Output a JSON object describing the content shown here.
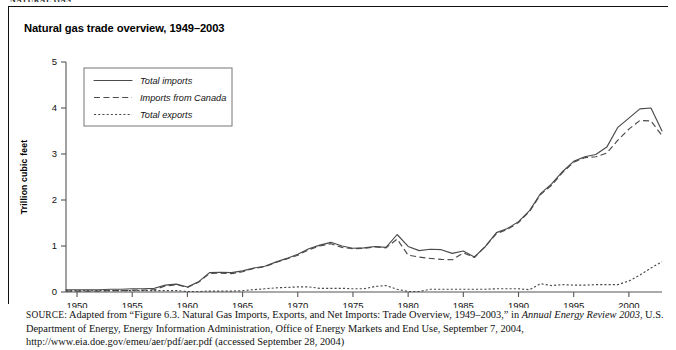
{
  "running_head": "NATURAL GAS",
  "figure": {
    "title": "Natural gas trade overview, 1949–2003"
  },
  "legend": {
    "items": [
      {
        "label": "Total imports",
        "style": "solid"
      },
      {
        "label": "Imports from Canada",
        "style": "dashed"
      },
      {
        "label": "Total exports",
        "style": "dotted"
      }
    ]
  },
  "source": {
    "label": "SOURCE:",
    "text_1": " Adapted from “Figure 6.3. Natural Gas Imports, Exports, and Net Imports: Trade Overview, 1949–2003,” in ",
    "italic_1": "Annual Energy Review 2003",
    "text_2": ", U.S. Department of Energy, Energy Information Administration, Office of Energy Markets and End Use, September 7, 2004, http://www.eia.doe.gov/emeu/aer/pdf/aer.pdf (accessed September 28, 2004)"
  },
  "chart_data": {
    "type": "line",
    "title": "Natural gas trade overview, 1949–2003",
    "xlabel": "",
    "ylabel": "Trillion cubic feet",
    "xlim": [
      1949,
      2003
    ],
    "ylim": [
      0,
      5
    ],
    "yticks": [
      0,
      1,
      2,
      3,
      4,
      5
    ],
    "xticks": [
      1950,
      1955,
      1960,
      1965,
      1970,
      1975,
      1980,
      1985,
      1990,
      1995,
      2000
    ],
    "grid": false,
    "legend_position": "upper-left",
    "x": [
      1949,
      1950,
      1951,
      1952,
      1953,
      1954,
      1955,
      1956,
      1957,
      1958,
      1959,
      1960,
      1961,
      1962,
      1963,
      1964,
      1965,
      1966,
      1967,
      1968,
      1969,
      1970,
      1971,
      1972,
      1973,
      1974,
      1975,
      1976,
      1977,
      1978,
      1979,
      1980,
      1981,
      1982,
      1983,
      1984,
      1985,
      1986,
      1987,
      1988,
      1989,
      1990,
      1991,
      1992,
      1993,
      1994,
      1995,
      1996,
      1997,
      1998,
      1999,
      2000,
      2001,
      2002,
      2003
    ],
    "series": [
      {
        "name": "Total imports",
        "style": "solid",
        "values": [
          0.05,
          0.05,
          0.05,
          0.05,
          0.06,
          0.06,
          0.07,
          0.07,
          0.08,
          0.15,
          0.17,
          0.11,
          0.22,
          0.42,
          0.43,
          0.42,
          0.46,
          0.52,
          0.56,
          0.65,
          0.73,
          0.82,
          0.94,
          1.02,
          1.08,
          1.0,
          0.95,
          0.96,
          0.99,
          0.97,
          1.25,
          0.99,
          0.9,
          0.93,
          0.92,
          0.84,
          0.89,
          0.76,
          0.99,
          1.29,
          1.38,
          1.53,
          1.77,
          2.14,
          2.35,
          2.62,
          2.84,
          2.94,
          2.99,
          3.15,
          3.58,
          3.78,
          3.98,
          4.0,
          3.5
        ]
      },
      {
        "name": "Imports from Canada",
        "style": "dashed",
        "values": [
          0.02,
          0.02,
          0.02,
          0.02,
          0.03,
          0.03,
          0.04,
          0.04,
          0.05,
          0.13,
          0.16,
          0.1,
          0.21,
          0.4,
          0.41,
          0.4,
          0.44,
          0.51,
          0.55,
          0.64,
          0.72,
          0.8,
          0.92,
          1.0,
          1.05,
          0.97,
          0.94,
          0.95,
          0.98,
          0.96,
          1.15,
          0.8,
          0.76,
          0.73,
          0.71,
          0.7,
          0.85,
          0.75,
          0.99,
          1.27,
          1.36,
          1.51,
          1.75,
          2.12,
          2.32,
          2.6,
          2.82,
          2.92,
          2.94,
          3.02,
          3.3,
          3.54,
          3.73,
          3.72,
          3.4
        ]
      },
      {
        "name": "Total exports",
        "style": "dotted",
        "values": [
          0.03,
          0.03,
          0.03,
          0.03,
          0.03,
          0.03,
          0.03,
          0.03,
          0.03,
          0.03,
          0.03,
          0.01,
          0.01,
          0.02,
          0.02,
          0.02,
          0.03,
          0.05,
          0.07,
          0.09,
          0.1,
          0.11,
          0.11,
          0.08,
          0.08,
          0.08,
          0.07,
          0.07,
          0.12,
          0.14,
          0.06,
          0.01,
          0.01,
          0.06,
          0.06,
          0.06,
          0.06,
          0.06,
          0.06,
          0.07,
          0.07,
          0.07,
          0.05,
          0.18,
          0.14,
          0.16,
          0.15,
          0.15,
          0.16,
          0.16,
          0.16,
          0.24,
          0.37,
          0.52,
          0.66
        ]
      }
    ]
  }
}
